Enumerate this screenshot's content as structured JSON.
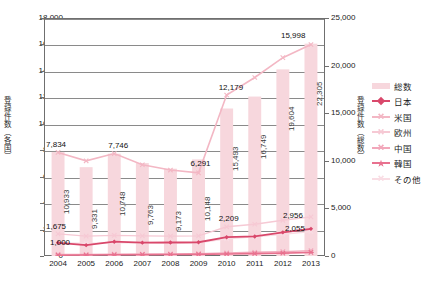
{
  "chart_data": {
    "type": "line",
    "title": "",
    "subtitle": "",
    "xlabel": "",
    "ylabel": "登録件数（各国）",
    "y2label": "登録件数（総数）",
    "grid": true,
    "legend_position": "right",
    "categories": [
      "2004",
      "2005",
      "2006",
      "2007",
      "2008",
      "2009",
      "2010",
      "2011",
      "2012",
      "2013"
    ],
    "ylim": [
      0,
      18000
    ],
    "yticks": [
      "0",
      "2,000",
      "4,000",
      "6,000",
      "8,000",
      "10,000",
      "12,000",
      "14,000",
      "16,000",
      "18,000"
    ],
    "y2lim": [
      0,
      25000
    ],
    "y2ticks": [
      "0",
      "5,000",
      "10,000",
      "15,000",
      "20,000",
      "25,000"
    ],
    "series": [
      {
        "name": "総数",
        "axis": "right",
        "type": "bar",
        "color": "#f7d7dd",
        "values": [
          10933,
          9331,
          10748,
          9763,
          9173,
          10148,
          15493,
          16749,
          19604,
          22305
        ],
        "labels": [
          "10,933",
          "9,331",
          "10,748",
          "9,763",
          "9,173",
          "10,148",
          "15,493",
          "16,749",
          "19,604",
          "22,305"
        ]
      },
      {
        "name": "日本",
        "axis": "left",
        "type": "line",
        "color": "#d9486b",
        "values": [
          1000,
          820,
          1080,
          1010,
          1020,
          1040,
          1420,
          1480,
          1790,
          2055
        ],
        "labels": [
          "1,000",
          "",
          "",
          "",
          "",
          "",
          "",
          "",
          "",
          "2,055"
        ]
      },
      {
        "name": "米国",
        "axis": "left",
        "type": "line",
        "color": "#f3b7c4",
        "values": [
          7834,
          7200,
          7746,
          6900,
          6500,
          6291,
          12179,
          13500,
          15000,
          15998
        ],
        "labels": [
          "7,834",
          "",
          "7,746",
          "",
          "",
          "6,291",
          "12,179",
          "",
          "",
          "15,998"
        ]
      },
      {
        "name": "欧州",
        "axis": "left",
        "type": "line",
        "color": "#f6c9d4",
        "values": [
          1675,
          1500,
          1560,
          1520,
          1500,
          1520,
          2209,
          2400,
          2700,
          2956
        ],
        "labels": [
          "1,675",
          "",
          "",
          "",
          "",
          "",
          "2,209",
          "",
          "",
          "2,956"
        ]
      },
      {
        "name": "中国",
        "axis": "left",
        "type": "line",
        "color": "#f2a7ba",
        "values": [
          120,
          110,
          140,
          150,
          160,
          180,
          230,
          280,
          330,
          400
        ]
      },
      {
        "name": "韓国",
        "axis": "left",
        "type": "line",
        "color": "#e8718f",
        "values": [
          60,
          70,
          90,
          100,
          110,
          120,
          150,
          180,
          220,
          270
        ]
      },
      {
        "name": "その他",
        "axis": "left",
        "type": "line",
        "color": "#f9dde4",
        "values": [
          1000,
          950,
          1010,
          1000,
          980,
          1000,
          1300,
          1450,
          1650,
          1850
        ]
      }
    ],
    "annotations": [
      {
        "text": "7,834",
        "series": "米国",
        "x": "2004"
      },
      {
        "text": "7,746",
        "series": "米国",
        "x": "2006"
      },
      {
        "text": "6,291",
        "series": "米国",
        "x": "2009"
      },
      {
        "text": "12,179",
        "series": "米国",
        "x": "2010"
      },
      {
        "text": "15,998",
        "series": "米国",
        "x": "2013"
      },
      {
        "text": "1,675",
        "series": "欧州",
        "x": "2004"
      },
      {
        "text": "2,209",
        "series": "欧州",
        "x": "2010"
      },
      {
        "text": "2,956",
        "series": "欧州",
        "x": "2013"
      },
      {
        "text": "1,000",
        "series": "日本",
        "x": "2004"
      },
      {
        "text": "2,055",
        "series": "日本",
        "x": "2013"
      }
    ]
  },
  "legend": {
    "items": [
      {
        "label": "総数"
      },
      {
        "label": "日本"
      },
      {
        "label": "米国"
      },
      {
        "label": "欧州"
      },
      {
        "label": "中国"
      },
      {
        "label": "韓国"
      },
      {
        "label": "その他"
      }
    ]
  }
}
